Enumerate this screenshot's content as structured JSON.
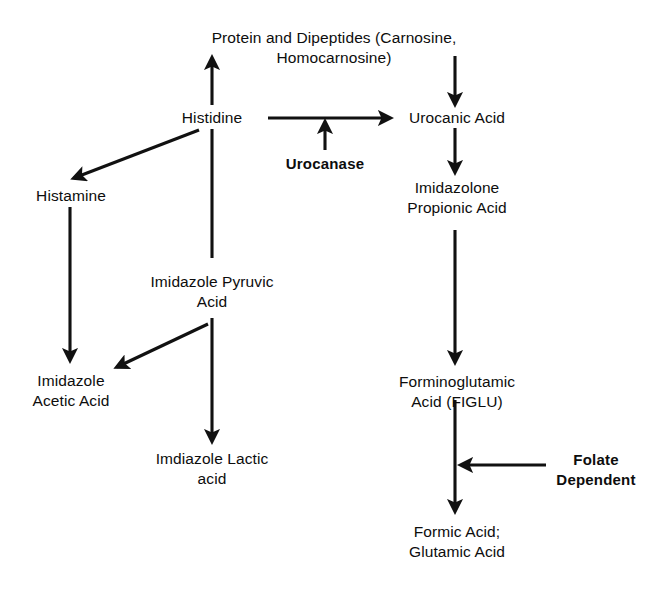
{
  "diagram": {
    "stroke_color": "#111111",
    "text_color": "#0d0d0d",
    "background_color": "#ffffff",
    "nodes": [
      {
        "id": "protein",
        "label": "Protein and Dipeptides (Carnosine, Homocarnosine)",
        "x": 334,
        "y": 28,
        "bold": false
      },
      {
        "id": "histidine",
        "label": "Histidine",
        "x": 212,
        "y": 108,
        "bold": false
      },
      {
        "id": "urocanic_acid",
        "label": "Urocanic Acid",
        "x": 457,
        "y": 108,
        "bold": false
      },
      {
        "id": "urocanase",
        "label": "Urocanase",
        "x": 325,
        "y": 154,
        "bold": true
      },
      {
        "id": "histamine",
        "label": "Histamine",
        "x": 71,
        "y": 186,
        "bold": false
      },
      {
        "id": "imidazolone",
        "label": "Imidazolone\nPropionic Acid",
        "x": 457,
        "y": 178,
        "bold": false
      },
      {
        "id": "imid_pyruvic",
        "label": "Imidazole Pyruvic\nAcid",
        "x": 212,
        "y": 272,
        "bold": false
      },
      {
        "id": "imid_acetic",
        "label": "Imidazole\nAcetic Acid",
        "x": 71,
        "y": 371,
        "bold": false
      },
      {
        "id": "figlu",
        "label": "Forminoglutamic\nAcid (FIGLU)",
        "x": 457,
        "y": 372,
        "bold": false
      },
      {
        "id": "imid_lactic",
        "label": "Imdiazole Lactic\nacid",
        "x": 212,
        "y": 449,
        "bold": false
      },
      {
        "id": "folate",
        "label": "Folate\nDependent",
        "x": 596,
        "y": 450,
        "bold": true
      },
      {
        "id": "formic_acid",
        "label": "Formic Acid;\nGlutamic Acid",
        "x": 457,
        "y": 522,
        "bold": false
      }
    ],
    "edges": [
      {
        "id": "histidine-to-protein",
        "from": "histidine",
        "to": "protein",
        "kind": "arrow",
        "x1": 212,
        "y1": 105,
        "x2": 212,
        "y2": 58
      },
      {
        "id": "protein-to-urocanic",
        "from": "protein",
        "to": "urocanic_acid",
        "kind": "arrow",
        "x1": 455,
        "y1": 56,
        "x2": 455,
        "y2": 104
      },
      {
        "id": "histidine-to-urocanic",
        "from": "histidine",
        "to": "urocanic_acid",
        "kind": "arrow",
        "x1": 268,
        "y1": 118,
        "x2": 390,
        "y2": 118
      },
      {
        "id": "urocanase-to-reaction",
        "from": "urocanase",
        "to": "histidine-to-urocanic",
        "kind": "arrow",
        "x1": 325,
        "y1": 150,
        "x2": 325,
        "y2": 122
      },
      {
        "id": "histidine-to-histamine",
        "from": "histidine",
        "to": "histamine",
        "kind": "arrow",
        "x1": 199,
        "y1": 130,
        "x2": 74,
        "y2": 178
      },
      {
        "id": "urocanic-to-imidazolone",
        "from": "urocanic_acid",
        "to": "imidazolone",
        "kind": "arrow",
        "x1": 455,
        "y1": 128,
        "x2": 455,
        "y2": 172
      },
      {
        "id": "histidine-to-imid-pyruvic",
        "from": "histidine",
        "to": "imid_pyruvic",
        "kind": "line",
        "x1": 212,
        "y1": 129,
        "x2": 212,
        "y2": 258
      },
      {
        "id": "histamine-to-imid-acetic",
        "from": "histamine",
        "to": "imid_acetic",
        "kind": "arrow",
        "x1": 70,
        "y1": 207,
        "x2": 70,
        "y2": 360
      },
      {
        "id": "imidazolone-to-figlu",
        "from": "imidazolone",
        "to": "figlu",
        "kind": "arrow",
        "x1": 455,
        "y1": 230,
        "x2": 455,
        "y2": 362
      },
      {
        "id": "imid-pyruvic-to-imid-acetic",
        "from": "imid_pyruvic",
        "to": "imid_acetic",
        "kind": "arrow",
        "x1": 208,
        "y1": 324,
        "x2": 117,
        "y2": 367
      },
      {
        "id": "imid-pyruvic-to-imid-lactic",
        "from": "imid_pyruvic",
        "to": "imid_lactic",
        "kind": "arrow",
        "x1": 212,
        "y1": 318,
        "x2": 212,
        "y2": 441
      },
      {
        "id": "figlu-to-formic-acid",
        "from": "figlu",
        "to": "formic_acid",
        "kind": "arrow",
        "x1": 455,
        "y1": 400,
        "x2": 455,
        "y2": 511
      },
      {
        "id": "folate-to-reaction",
        "from": "folate",
        "to": "figlu-to-formic-acid",
        "kind": "arrow",
        "x1": 546,
        "y1": 465,
        "x2": 461,
        "y2": 465
      }
    ]
  }
}
